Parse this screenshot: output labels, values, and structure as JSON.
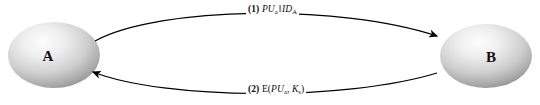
{
  "diagram": {
    "type": "sequence-exchange",
    "background_color": "#ffffff",
    "line_color": "#000000",
    "nodes": [
      {
        "id": "a",
        "label": "A",
        "cx": 54,
        "cy": 55,
        "rx": 46,
        "ry": 33,
        "fill_light": "#f2f2f2",
        "fill_mid": "#c9c9c9",
        "fill_dark": "#8e8e8e"
      },
      {
        "id": "b",
        "label": "B",
        "cx": 486,
        "cy": 56,
        "rx": 46,
        "ry": 32,
        "fill_light": "#f2f2f2",
        "fill_mid": "#c9c9c9",
        "fill_dark": "#8e8e8e"
      }
    ],
    "edges": [
      {
        "id": "msg1",
        "from": "A",
        "to": "B",
        "direction": "a-to-b",
        "seq": "(1)",
        "label_plain": "(1) PUa || IDA",
        "parts": {
          "seq": "(1)",
          "term1_base": "PU",
          "term1_sub": "a",
          "operator": "‖",
          "term2_base": "ID",
          "term2_sub": "A"
        }
      },
      {
        "id": "msg2",
        "from": "B",
        "to": "A",
        "direction": "b-to-a",
        "seq": "(2)",
        "label_plain": "(2) E(PUa, Ks)",
        "parts": {
          "seq": "(2)",
          "func": "E(",
          "term1_base": "PU",
          "term1_sub": "a",
          "separator": ", ",
          "term2_base": "K",
          "term2_sub": "s",
          "close": ")"
        }
      }
    ]
  }
}
